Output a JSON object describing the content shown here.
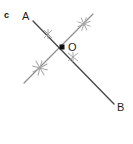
{
  "figure": {
    "canvas": {
      "width": 133,
      "height": 144,
      "background": "#ffffff"
    },
    "labels": {
      "line_c": "c",
      "point_a": "A",
      "point_o": "O",
      "point_b": "B"
    },
    "colors": {
      "line_ab": "#4a4a4a",
      "line_c": "#8f8f8f",
      "tick_mark": "#a6a6a6",
      "point_dot": "#111111",
      "text": "#1a1a1a"
    },
    "label_positions": {
      "line_c": {
        "x": 4,
        "y": 12
      },
      "point_a": {
        "x": 22,
        "y": 12
      },
      "point_o": {
        "x": 68,
        "y": 42
      },
      "point_b": {
        "x": 117,
        "y": 103
      }
    },
    "geometry": {
      "intersection_point": {
        "name": "O",
        "x": 62,
        "y": 47
      },
      "segments": [
        {
          "name": "segment-ab",
          "from_label": "A",
          "to_label": "B",
          "x1": 33,
          "y1": 21,
          "x2": 114,
          "y2": 104,
          "stroke": "#4a4a4a",
          "stroke_width": 1.4
        },
        {
          "name": "line-c",
          "from_label": "",
          "to_label": "",
          "x1": 24,
          "y1": 83,
          "x2": 93,
          "y2": 14,
          "stroke": "#8f8f8f",
          "stroke_width": 1.2
        }
      ],
      "tick_marks": [
        {
          "name": "tick-upper-right",
          "x": 84,
          "y": 24,
          "size": 7,
          "rotation": 20
        },
        {
          "name": "tick-upper-left",
          "x": 48,
          "y": 34,
          "size": 6,
          "rotation": 0
        },
        {
          "name": "tick-lower-left",
          "x": 40,
          "y": 68,
          "size": 8,
          "rotation": 15
        },
        {
          "name": "tick-lower-right",
          "x": 73,
          "y": 57,
          "size": 6,
          "rotation": 0
        }
      ]
    }
  }
}
